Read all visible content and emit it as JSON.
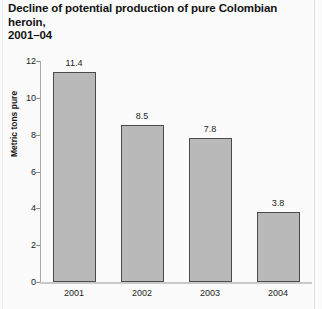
{
  "chart_data": {
    "type": "bar",
    "title": "Decline of potential production of pure Colombian heroin, 2001–04",
    "title_lines": [
      "Decline of potential production of pure Colombian heroin,",
      "2001–04"
    ],
    "xlabel": "",
    "ylabel": "Metric tons pure",
    "categories": [
      "2001",
      "2002",
      "2003",
      "2004"
    ],
    "values": [
      11.4,
      8.5,
      7.8,
      3.8
    ],
    "value_labels": [
      "11.4",
      "8.5",
      "7.8",
      "3.8"
    ],
    "ylim": [
      0,
      12
    ],
    "yticks": [
      0,
      2,
      4,
      6,
      8,
      10,
      12
    ],
    "ytick_labels": [
      "0",
      "2",
      "4",
      "6",
      "8",
      "10",
      "12"
    ],
    "grid": false,
    "legend": false,
    "bar_fill_color": "#b9b9b9",
    "bar_border_color": "#4a4a4a",
    "axis_color": "#a9a9a9",
    "text_color": "#1a1a1a",
    "background_color": "#fbfbfb"
  }
}
